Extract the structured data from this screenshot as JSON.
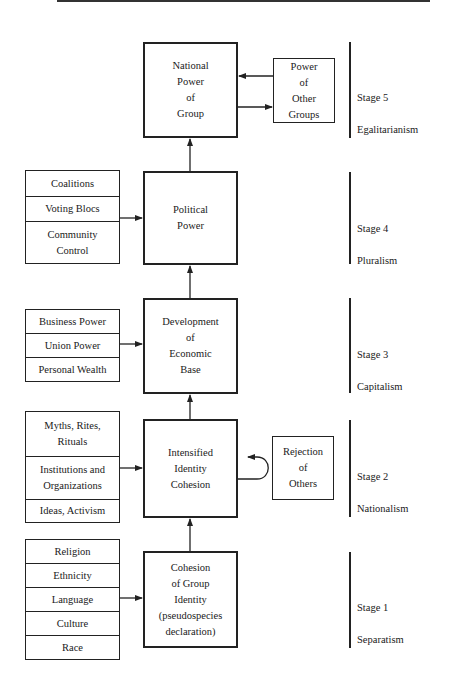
{
  "diagram": {
    "stages": [
      {
        "id": "stage5",
        "label": "Stage 5",
        "name": "Egalitarianism"
      },
      {
        "id": "stage4",
        "label": "Stage 4",
        "name": "Pluralism"
      },
      {
        "id": "stage3",
        "label": "Stage 3",
        "name": "Capitalism"
      },
      {
        "id": "stage2",
        "label": "Stage 2",
        "name": "Nationalism"
      },
      {
        "id": "stage1",
        "label": "Stage 1",
        "name": "Separatism"
      }
    ],
    "main_boxes": {
      "national_power": "National\nPower\nof\nGroup",
      "political_power": "Political\nPower",
      "economic_base": "Development\nof\nEconomic\nBase",
      "identity_cohesion": "Intensified\nIdentity\nCohesion",
      "group_identity": "Cohesion\nof Group\nIdentity\n(pseudospecies\ndeclaration)"
    },
    "side_boxes": {
      "other_groups": "Power\nof\nOther\nGroups",
      "rejection": "Rejection\nof\nOthers"
    },
    "input_lists": {
      "stage4": [
        "Coalitions",
        "Voting Blocs",
        "Community\nControl"
      ],
      "stage3": [
        "Business Power",
        "Union Power",
        "Personal Wealth"
      ],
      "stage2": [
        "Myths, Rites,\nRituals",
        "Institutions and\nOrganizations",
        "Ideas, Activism"
      ],
      "stage1": [
        "Religion",
        "Ethnicity",
        "Language",
        "Culture",
        "Race"
      ]
    }
  }
}
